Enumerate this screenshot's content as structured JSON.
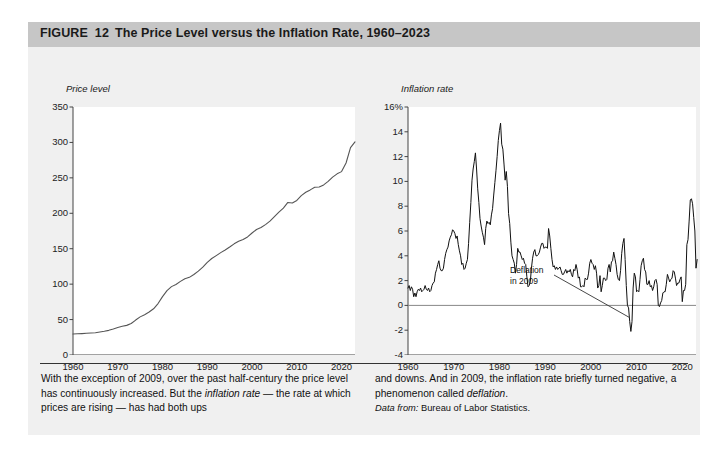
{
  "figure": {
    "label": "FIGURE",
    "number": "12",
    "title": "The Price Level versus the Inflation Rate, 1960–2023"
  },
  "caption": {
    "left_part1": "With the exception of 2009, over the past half-century the price level has continuously increased. But the ",
    "left_italic1": "inflation rate",
    "left_part2": " — the rate at which prices are rising — has had both ups",
    "right_part1": "and downs. And in 2009, the inflation rate briefly turned negative, a phenomenon called ",
    "right_italic1": "deflation",
    "right_part2": ".",
    "source_label": "Data from:",
    "source_text": " Bureau of Labor Statistics."
  },
  "chart_data": [
    {
      "id": "price-level",
      "type": "line",
      "title": "Price level",
      "xlabel": "",
      "ylabel": "Price level",
      "grid": false,
      "legend": "none",
      "line_color": "#555555",
      "xlim": [
        1960,
        2023
      ],
      "ylim": [
        0,
        350
      ],
      "yticks": [
        "350",
        "300",
        "250",
        "200",
        "150",
        "100",
        "50",
        "0"
      ],
      "ytick_values": [
        350,
        300,
        250,
        200,
        150,
        100,
        50,
        0
      ],
      "xticks": [
        "1960",
        "1970",
        "1980",
        "1990",
        "2000",
        "2010",
        "2020"
      ],
      "xtick_values": [
        1960,
        1970,
        1980,
        1990,
        2000,
        2010,
        2020
      ],
      "x": [
        1960,
        1961,
        1962,
        1963,
        1964,
        1965,
        1966,
        1967,
        1968,
        1969,
        1970,
        1971,
        1972,
        1973,
        1974,
        1975,
        1976,
        1977,
        1978,
        1979,
        1980,
        1981,
        1982,
        1983,
        1984,
        1985,
        1986,
        1987,
        1988,
        1989,
        1990,
        1991,
        1992,
        1993,
        1994,
        1995,
        1996,
        1997,
        1998,
        1999,
        2000,
        2001,
        2002,
        2003,
        2004,
        2005,
        2006,
        2007,
        2008,
        2009,
        2010,
        2011,
        2012,
        2013,
        2014,
        2015,
        2016,
        2017,
        2018,
        2019,
        2020,
        2021,
        2022,
        2023
      ],
      "values": [
        29.6,
        29.9,
        30.2,
        30.6,
        31.0,
        31.5,
        32.4,
        33.4,
        34.8,
        36.7,
        38.8,
        40.5,
        41.8,
        44.4,
        49.3,
        53.8,
        56.9,
        60.6,
        65.2,
        72.6,
        82.4,
        90.9,
        96.5,
        99.6,
        103.9,
        107.6,
        109.6,
        113.6,
        118.3,
        124.0,
        130.7,
        136.2,
        140.3,
        144.5,
        148.2,
        152.4,
        156.9,
        160.5,
        163.0,
        166.6,
        172.2,
        177.1,
        179.9,
        184.0,
        188.9,
        195.3,
        201.6,
        207.3,
        215.3,
        214.5,
        218.1,
        224.9,
        229.6,
        233.0,
        236.7,
        237.0,
        240.0,
        245.1,
        251.1,
        255.7,
        258.8,
        271.0,
        292.7,
        300.8
      ]
    },
    {
      "id": "inflation-rate",
      "type": "line",
      "title": "Inflation rate",
      "xlabel": "",
      "ylabel": "Inflation rate",
      "grid": false,
      "legend": "none",
      "line_color": "#111111",
      "zero_line": 0,
      "xlim": [
        1960,
        2023
      ],
      "ylim": [
        -4,
        16
      ],
      "yticks": [
        "16%",
        "14",
        "12",
        "10",
        "8",
        "6",
        "4",
        "2",
        "0",
        "-2",
        "-4"
      ],
      "ytick_values": [
        16,
        14,
        12,
        10,
        8,
        6,
        4,
        2,
        0,
        -2,
        -4
      ],
      "xticks": [
        "1960",
        "1970",
        "1980",
        "1990",
        "2000",
        "2010",
        "2020"
      ],
      "xtick_values": [
        1960,
        1970,
        1980,
        1990,
        2000,
        2010,
        2020
      ],
      "annotation": {
        "line1": "Deflation",
        "line2": "in 2009",
        "target_x": 2009,
        "target_y": -1.0
      },
      "x": [
        1960.0,
        1960.25,
        1960.5,
        1960.75,
        1961.0,
        1961.25,
        1961.5,
        1961.75,
        1962.0,
        1962.25,
        1962.5,
        1962.75,
        1963.0,
        1963.25,
        1963.5,
        1963.75,
        1964.0,
        1964.25,
        1964.5,
        1964.75,
        1965.0,
        1965.25,
        1965.5,
        1965.75,
        1966.0,
        1966.25,
        1966.5,
        1966.75,
        1967.0,
        1967.25,
        1967.5,
        1967.75,
        1968.0,
        1968.25,
        1968.5,
        1968.75,
        1969.0,
        1969.25,
        1969.5,
        1969.75,
        1970.0,
        1970.25,
        1970.5,
        1970.75,
        1971.0,
        1971.25,
        1971.5,
        1971.75,
        1972.0,
        1972.25,
        1972.5,
        1972.75,
        1973.0,
        1973.25,
        1973.5,
        1973.75,
        1974.0,
        1974.25,
        1974.5,
        1974.75,
        1975.0,
        1975.25,
        1975.5,
        1975.75,
        1976.0,
        1976.25,
        1976.5,
        1976.75,
        1977.0,
        1977.25,
        1977.5,
        1977.75,
        1978.0,
        1978.25,
        1978.5,
        1978.75,
        1979.0,
        1979.25,
        1979.5,
        1979.75,
        1980.0,
        1980.25,
        1980.5,
        1980.75,
        1981.0,
        1981.25,
        1981.5,
        1981.75,
        1982.0,
        1982.25,
        1982.5,
        1982.75,
        1983.0,
        1983.25,
        1983.5,
        1983.75,
        1984.0,
        1984.25,
        1984.5,
        1984.75,
        1985.0,
        1985.25,
        1985.5,
        1985.75,
        1986.0,
        1986.25,
        1986.5,
        1986.75,
        1987.0,
        1987.25,
        1987.5,
        1987.75,
        1988.0,
        1988.25,
        1988.5,
        1988.75,
        1989.0,
        1989.25,
        1989.5,
        1989.75,
        1990.0,
        1990.25,
        1990.5,
        1990.75,
        1991.0,
        1991.25,
        1991.5,
        1991.75,
        1992.0,
        1992.25,
        1992.5,
        1992.75,
        1993.0,
        1993.25,
        1993.5,
        1993.75,
        1994.0,
        1994.25,
        1994.5,
        1994.75,
        1995.0,
        1995.25,
        1995.5,
        1995.75,
        1996.0,
        1996.25,
        1996.5,
        1996.75,
        1997.0,
        1997.25,
        1997.5,
        1997.75,
        1998.0,
        1998.25,
        1998.5,
        1998.75,
        1999.0,
        1999.25,
        1999.5,
        1999.75,
        2000.0,
        2000.25,
        2000.5,
        2000.75,
        2001.0,
        2001.25,
        2001.5,
        2001.75,
        2002.0,
        2002.25,
        2002.5,
        2002.75,
        2003.0,
        2003.25,
        2003.5,
        2003.75,
        2004.0,
        2004.25,
        2004.5,
        2004.75,
        2005.0,
        2005.25,
        2005.5,
        2005.75,
        2006.0,
        2006.25,
        2006.5,
        2006.75,
        2007.0,
        2007.25,
        2007.5,
        2007.75,
        2008.0,
        2008.25,
        2008.5,
        2008.75,
        2009.0,
        2009.25,
        2009.5,
        2009.75,
        2010.0,
        2010.25,
        2010.5,
        2010.75,
        2011.0,
        2011.25,
        2011.5,
        2011.75,
        2012.0,
        2012.25,
        2012.5,
        2012.75,
        2013.0,
        2013.25,
        2013.5,
        2013.75,
        2014.0,
        2014.25,
        2014.5,
        2014.75,
        2015.0,
        2015.25,
        2015.5,
        2015.75,
        2016.0,
        2016.25,
        2016.5,
        2016.75,
        2017.0,
        2017.25,
        2017.5,
        2017.75,
        2018.0,
        2018.25,
        2018.5,
        2018.75,
        2019.0,
        2019.25,
        2019.5,
        2019.75,
        2020.0,
        2020.25,
        2020.5,
        2020.75,
        2021.0,
        2021.25,
        2021.5,
        2021.75,
        2022.0,
        2022.25,
        2022.5,
        2022.75,
        2023.0,
        2023.25,
        2023.5
      ],
      "values": [
        1.4,
        1.6,
        1.2,
        1.5,
        1.3,
        0.7,
        1.0,
        0.7,
        1.1,
        1.3,
        1.2,
        1.4,
        1.1,
        1.2,
        1.3,
        1.6,
        1.3,
        1.2,
        1.4,
        1.1,
        1.2,
        1.6,
        1.8,
        1.9,
        2.6,
        2.9,
        3.3,
        3.6,
        3.0,
        2.8,
        2.8,
        3.0,
        3.7,
        4.2,
        4.5,
        4.7,
        5.2,
        5.5,
        5.7,
        6.1,
        6.0,
        5.8,
        5.4,
        5.6,
        4.9,
        4.4,
        4.0,
        3.3,
        3.4,
        2.9,
        3.0,
        3.4,
        3.7,
        5.0,
        6.7,
        8.3,
        10.1,
        11.0,
        11.6,
        12.3,
        11.0,
        9.4,
        8.3,
        7.0,
        6.4,
        5.9,
        5.5,
        4.9,
        6.2,
        6.8,
        6.6,
        6.7,
        6.5,
        7.3,
        7.8,
        8.9,
        9.9,
        10.9,
        12.0,
        13.3,
        14.1,
        14.7,
        13.0,
        12.6,
        11.4,
        10.1,
        10.8,
        9.6,
        7.4,
        6.6,
        5.1,
        4.0,
        3.7,
        3.4,
        2.6,
        3.3,
        4.6,
        4.3,
        4.3,
        4.0,
        3.7,
        3.8,
        3.4,
        3.3,
        2.3,
        1.5,
        1.6,
        1.9,
        3.0,
        3.8,
        4.3,
        4.5,
        4.0,
        4.0,
        4.1,
        4.3,
        4.7,
        5.0,
        5.0,
        4.6,
        4.7,
        4.7,
        4.6,
        6.2,
        5.6,
        4.6,
        3.7,
        3.1,
        3.2,
        2.9,
        3.1,
        2.9,
        3.0,
        3.1,
        2.8,
        2.5,
        2.5,
        2.7,
        2.9,
        2.6,
        2.8,
        2.7,
        2.9,
        2.5,
        2.3,
        2.9,
        2.8,
        3.3,
        2.9,
        2.2,
        2.3,
        1.5,
        1.5,
        1.6,
        1.5,
        2.2,
        2.1,
        2.1,
        2.6,
        3.4,
        3.7,
        3.4,
        3.3,
        2.9,
        3.2,
        2.6,
        1.4,
        1.6,
        2.4,
        1.1,
        1.6,
        2.2,
        2.2,
        2.0,
        2.1,
        3.0,
        3.3,
        2.7,
        3.5,
        3.6,
        4.3,
        3.8,
        3.3,
        2.5,
        2.1,
        2.0,
        2.8,
        4.2,
        5.0,
        5.4,
        3.7,
        1.6,
        0.0,
        -0.2,
        -1.3,
        -2.1,
        -1.3,
        1.4,
        2.6,
        2.3,
        1.1,
        1.2,
        1.1,
        2.1,
        3.2,
        3.6,
        3.8,
        2.9,
        2.7,
        1.7,
        1.7,
        2.0,
        1.5,
        1.6,
        1.2,
        1.5,
        2.0,
        2.1,
        1.7,
        0.0,
        -0.1,
        0.2,
        0.4,
        1.0,
        1.1,
        1.1,
        1.7,
        2.5,
        2.2,
        1.9,
        2.1,
        2.2,
        2.8,
        2.7,
        2.2,
        1.6,
        1.8,
        1.8,
        2.1,
        2.3,
        0.3,
        1.2,
        1.2,
        1.7,
        4.9,
        5.3,
        6.8,
        8.5,
        8.6,
        8.2,
        7.1,
        6.0,
        3.0,
        3.7
      ]
    }
  ]
}
